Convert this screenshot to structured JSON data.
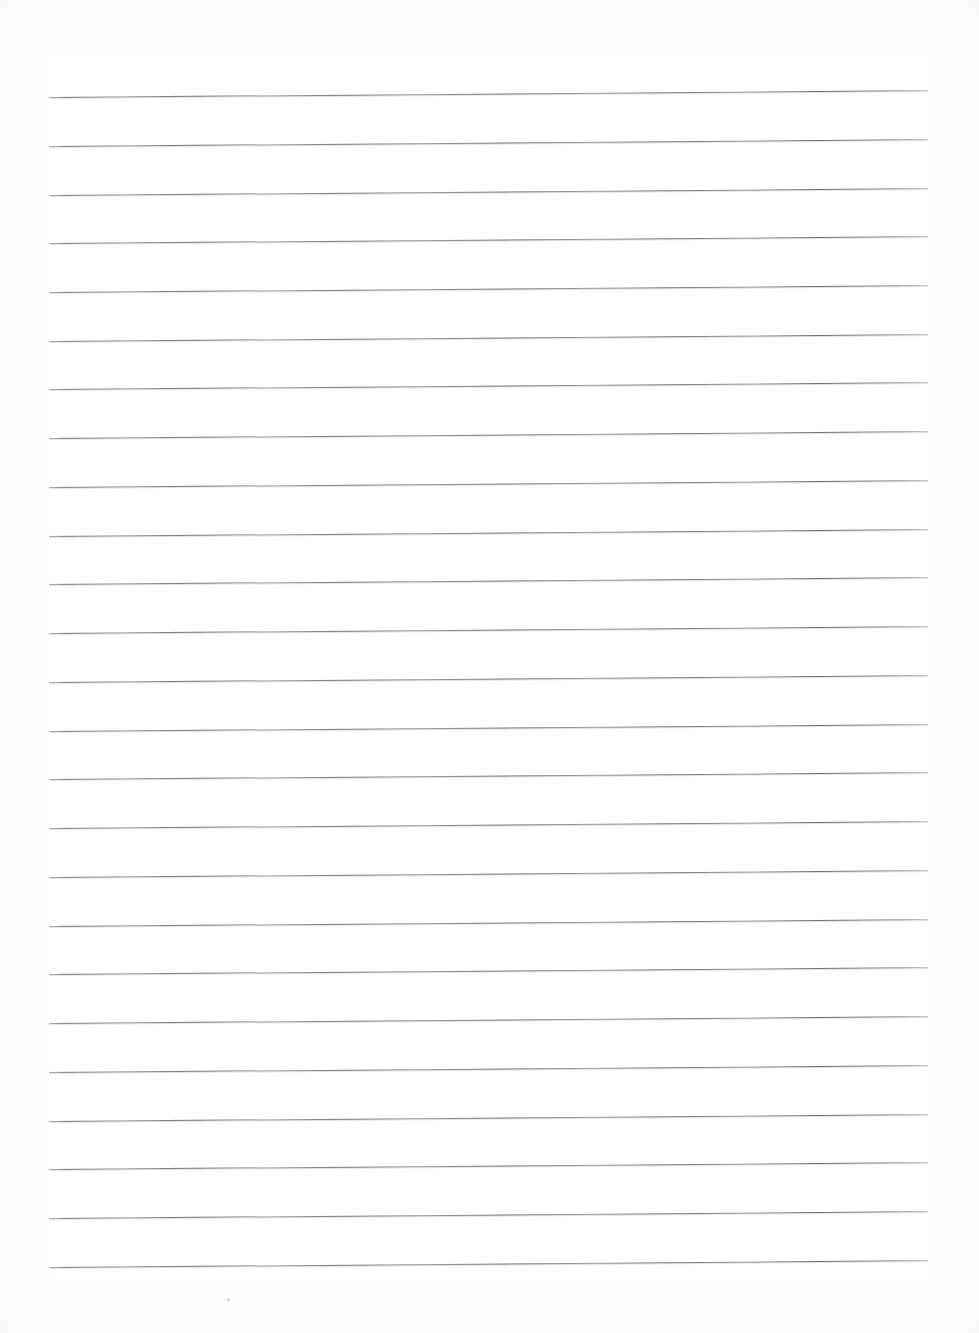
{
  "document": {
    "kind": "scanned-lined-paper",
    "title": "Blank ruled notebook page",
    "page_width": 979,
    "page_height": 1333,
    "background_color": "#ffffff",
    "visible_text": "",
    "written_content": "",
    "notes_label": ""
  },
  "ruling": {
    "line_color": "#6e6e72",
    "line_count": 25,
    "line_thickness_px": 1,
    "first_line_y": 97,
    "line_spacing_px": 48.8,
    "line_start_x": 49,
    "line_end_x": 928,
    "tilt_degrees": -0.45,
    "lines": [
      {
        "index": 1,
        "y": 97
      },
      {
        "index": 2,
        "y": 146
      },
      {
        "index": 3,
        "y": 195
      },
      {
        "index": 4,
        "y": 243
      },
      {
        "index": 5,
        "y": 292
      },
      {
        "index": 6,
        "y": 341
      },
      {
        "index": 7,
        "y": 389
      },
      {
        "index": 8,
        "y": 438
      },
      {
        "index": 9,
        "y": 487
      },
      {
        "index": 10,
        "y": 536
      },
      {
        "index": 11,
        "y": 584
      },
      {
        "index": 12,
        "y": 633
      },
      {
        "index": 13,
        "y": 682
      },
      {
        "index": 14,
        "y": 731
      },
      {
        "index": 15,
        "y": 779
      },
      {
        "index": 16,
        "y": 828
      },
      {
        "index": 17,
        "y": 877
      },
      {
        "index": 18,
        "y": 926
      },
      {
        "index": 19,
        "y": 974
      },
      {
        "index": 20,
        "y": 1023
      },
      {
        "index": 21,
        "y": 1072
      },
      {
        "index": 22,
        "y": 1121
      },
      {
        "index": 23,
        "y": 1169
      },
      {
        "index": 24,
        "y": 1218
      },
      {
        "index": 25,
        "y": 1267
      }
    ]
  },
  "margins": {
    "top_blank_px": 97,
    "bottom_blank_px": 66,
    "left_blank_px": 49,
    "right_blank_px": 51
  },
  "artifacts": {
    "specks": [
      {
        "x": 227,
        "y": 1298,
        "size": 3
      }
    ]
  }
}
